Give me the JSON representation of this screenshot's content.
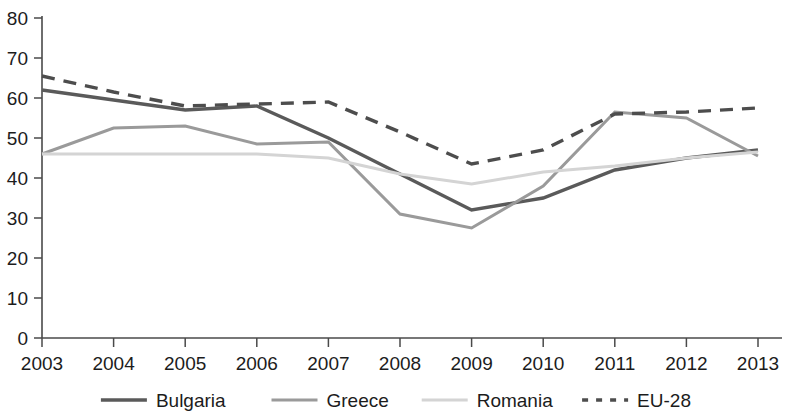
{
  "chart_data": {
    "type": "line",
    "title": "",
    "subtitle": "",
    "xlabel": "",
    "ylabel": "",
    "categories": [
      "2003",
      "2004",
      "2005",
      "2006",
      "2007",
      "2008",
      "2009",
      "2010",
      "2011",
      "2012",
      "2013"
    ],
    "x": [
      2003,
      2004,
      2005,
      2006,
      2007,
      2008,
      2009,
      2010,
      2011,
      2012,
      2013
    ],
    "ylim": [
      0,
      80
    ],
    "xlim": [
      2003,
      2013
    ],
    "yticks": [
      0,
      10,
      20,
      30,
      40,
      50,
      60,
      70,
      80
    ],
    "ytick_labels": [
      "0",
      "10",
      "20",
      "30",
      "40",
      "50",
      "60",
      "70",
      "80"
    ],
    "grid": false,
    "legend_position": "bottom",
    "series": [
      {
        "name": "Bulgaria",
        "values": [
          62,
          59.5,
          57,
          58,
          50,
          41,
          32,
          35,
          42,
          45,
          47
        ],
        "color": "#5a5a5a",
        "style": "solid",
        "width": 3.4
      },
      {
        "name": "Greece",
        "values": [
          46,
          52.5,
          53,
          48.5,
          49,
          31,
          27.5,
          38,
          56.5,
          55,
          45.5
        ],
        "color": "#9a9a9a",
        "style": "solid",
        "width": 3.0
      },
      {
        "name": "Romania",
        "values": [
          46,
          46,
          46,
          46,
          45,
          41,
          38.5,
          41.5,
          43,
          45,
          46.5
        ],
        "color": "#d4d4d4",
        "style": "solid",
        "width": 3.0
      },
      {
        "name": "EU-28",
        "values": [
          65.5,
          61.5,
          58,
          58.5,
          59,
          51.5,
          43.5,
          47,
          56,
          56.5,
          57.5
        ],
        "color": "#4d4d4d",
        "style": "dashed",
        "width": 3.4
      }
    ]
  },
  "legend": {
    "items": [
      {
        "label": "Bulgaria"
      },
      {
        "label": "Greece"
      },
      {
        "label": "Romania"
      },
      {
        "label": "EU-28"
      }
    ]
  },
  "colors": {
    "axis": "#4a4a4a",
    "text": "#1c1c1c",
    "background": "#ffffff"
  }
}
